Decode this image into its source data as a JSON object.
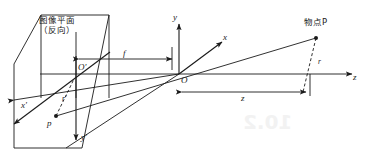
{
  "figure": {
    "title_note": "pinhole-camera-projection-geometry",
    "stroke_color": "#1a1a1a",
    "background_color": "#ffffff",
    "bleed_color": "#f2f2f2",
    "labels": {
      "image_plane_line1": "图像平面",
      "image_plane_line2": "（反向）",
      "object_point": "物点P",
      "focal_length": "f",
      "depth": "z",
      "origin": "O",
      "origin_prime": "O'",
      "image_point": "p",
      "radius": "r",
      "radius_prime": "r'",
      "axis_x": "x",
      "axis_y": "y",
      "axis_z": "z",
      "axis_x_prime": "x'",
      "axis_y_prime": "y'"
    },
    "bleed_through": {
      "page_number": "10.2"
    }
  }
}
